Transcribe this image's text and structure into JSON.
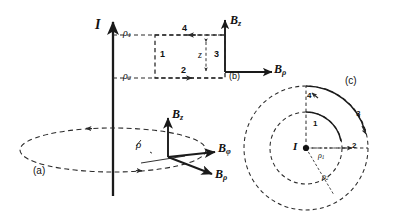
{
  "figure": {
    "type": "physics-diagram",
    "background_color": "#ffffff",
    "line_color": "#1a1a1a",
    "dash_color": "#2a2a2a"
  },
  "panel_a": {
    "tag": "(a)",
    "current_label": "I",
    "rho_label": "ρ",
    "vectors": [
      {
        "name": "B_z",
        "base": "B",
        "sub": "z"
      },
      {
        "name": "B_phi",
        "base": "B",
        "sub": "φ"
      },
      {
        "name": "B_rho",
        "base": "B",
        "sub": "ρ"
      }
    ]
  },
  "panel_b": {
    "tag": "(b)",
    "axis_vertical": {
      "base": "B",
      "sub": "z"
    },
    "axis_horizontal": {
      "base": "B",
      "sub": "ρ"
    },
    "radius_labels": [
      {
        "base": "ρ",
        "sub": "1"
      },
      {
        "base": "ρ",
        "sub": "2"
      }
    ],
    "height_label": "z",
    "loop_sides": [
      "1",
      "2",
      "3",
      "4"
    ]
  },
  "panel_c": {
    "tag": "(c)",
    "center_label": "I",
    "radius_labels": [
      {
        "base": "ρ",
        "sub": "1"
      },
      {
        "base": "ρ",
        "sub": "2"
      }
    ],
    "arc_sides": [
      "1",
      "2",
      "3",
      "4"
    ]
  }
}
